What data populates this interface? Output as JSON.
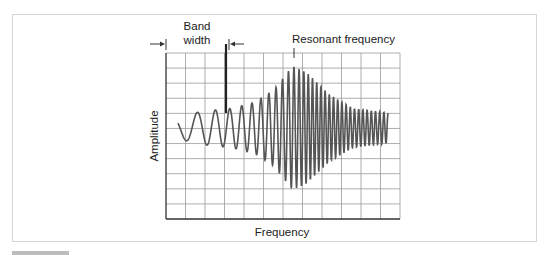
{
  "figure": {
    "labels": {
      "band_width_line1": "Band",
      "band_width_line2": "width",
      "resonant_frequency": "Resonant frequency",
      "y_axis": "Amplitude",
      "x_axis": "Frequency"
    },
    "colors": {
      "grid": "#9a9a9a",
      "axis": "#333333",
      "wave": "#555555",
      "frame": "#d6d6d6",
      "footer_bar": "#bdbdbd"
    },
    "grid": {
      "columns": 12,
      "rows": 11
    }
  },
  "chart_data": {
    "type": "line",
    "title": "",
    "xlabel": "Frequency",
    "ylabel": "Amplitude",
    "grid": true,
    "annotations": [
      {
        "text": "Band width",
        "kind": "double-arrow span",
        "x_start_fraction": 0.0,
        "x_end_fraction": 0.26
      },
      {
        "text": "Resonant frequency",
        "kind": "tick marker",
        "x_fraction": 0.54
      }
    ],
    "envelope": {
      "x_fraction": [
        0.05,
        0.15,
        0.28,
        0.38,
        0.46,
        0.54,
        0.6,
        0.7,
        0.8,
        0.95
      ],
      "half_amplitude_grid_units": [
        0.7,
        1.1,
        1.3,
        1.7,
        2.5,
        4.1,
        3.7,
        2.2,
        1.3,
        1.0
      ]
    },
    "resonant_x_fraction": 0.55
  }
}
